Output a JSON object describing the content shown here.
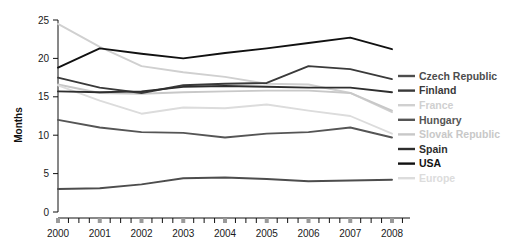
{
  "chart_data": {
    "type": "line",
    "title": "",
    "xlabel": "",
    "ylabel": "Months",
    "x": [
      2000,
      2001,
      2002,
      2003,
      2004,
      2005,
      2006,
      2007,
      2008
    ],
    "xtick_labels": [
      "2000",
      "2001",
      "2002",
      "2003",
      "2004",
      "2005",
      "2006",
      "2007",
      "2008"
    ],
    "ytick_labels": [
      "0",
      "5",
      "10",
      "15",
      "20",
      "25"
    ],
    "ytick_values": [
      0,
      5,
      10,
      15,
      20,
      25
    ],
    "ylim": [
      0,
      25
    ],
    "xlim": [
      2000,
      2008
    ],
    "grid": false,
    "minor_ticks_per_interval": 4,
    "legend_position": "right",
    "series": [
      {
        "name": "Czech Republic",
        "color": "#4d4d4d",
        "values": [
          3.0,
          3.1,
          3.6,
          4.4,
          4.5,
          4.3,
          4.0,
          4.1,
          4.2
        ]
      },
      {
        "name": "Finland",
        "color": "#3a3a3a",
        "values": [
          17.5,
          16.2,
          15.5,
          16.5,
          16.7,
          16.8,
          19.0,
          18.6,
          17.3
        ]
      },
      {
        "name": "France",
        "color": "#d0d0d0",
        "values": [
          24.5,
          21.5,
          19.0,
          18.2,
          17.6,
          16.7,
          16.6,
          15.5,
          13.0
        ]
      },
      {
        "name": "Hungary",
        "color": "#555555",
        "values": [
          12.0,
          11.0,
          10.4,
          10.3,
          9.7,
          10.2,
          10.4,
          11.0,
          9.7
        ]
      },
      {
        "name": "Slovak Republic",
        "color": "#c8c8c8",
        "values": [
          16.6,
          15.5,
          15.4,
          15.6,
          15.7,
          15.8,
          15.8,
          15.5,
          13.2
        ]
      },
      {
        "name": "Spain",
        "color": "#2e2e2e",
        "values": [
          15.7,
          15.6,
          15.7,
          16.3,
          16.4,
          16.3,
          16.2,
          16.2,
          15.6
        ]
      },
      {
        "name": "USA",
        "color": "#111111",
        "values": [
          18.8,
          21.3,
          20.6,
          20.0,
          20.7,
          21.3,
          22.0,
          22.7,
          21.2
        ]
      },
      {
        "name": "Europe",
        "color": "#dcdcdc",
        "values": [
          16.5,
          14.5,
          12.8,
          13.6,
          13.5,
          14.0,
          13.2,
          12.5,
          10.2
        ]
      }
    ]
  },
  "legend": {
    "items": [
      {
        "label": "Czech Republic"
      },
      {
        "label": "Finland"
      },
      {
        "label": "France"
      },
      {
        "label": "Hungary"
      },
      {
        "label": "Slovak Republic"
      },
      {
        "label": "Spain"
      },
      {
        "label": "USA"
      },
      {
        "label": "Europe"
      }
    ]
  },
  "axes": {
    "y_title": "Months"
  }
}
